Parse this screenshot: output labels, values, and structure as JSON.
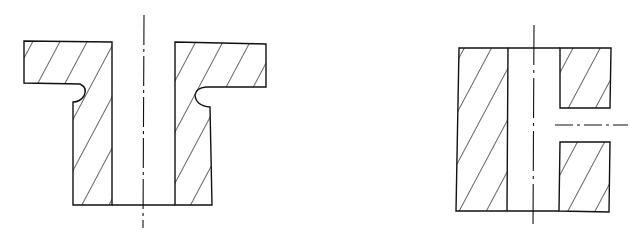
{
  "diagram": {
    "type": "engineering-cross-section",
    "stroke_color": "#111111",
    "background": "#ffffff",
    "views": [
      {
        "id": "flanged-bushing",
        "description": "Flanged bushing section with undercut grooves and central bore"
      },
      {
        "id": "sleeve-with-side-hole",
        "description": "Sleeve section with central bore and radial side hole on right wall"
      }
    ]
  }
}
